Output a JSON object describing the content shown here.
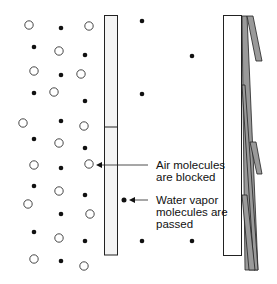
{
  "diagram": {
    "colors": {
      "stroke": "#222222",
      "membrane_fill": "#f4f4f4",
      "flap_fill": "#9a9a9a",
      "dot": "#111111"
    },
    "labels": {
      "air": [
        "Air molecules",
        "are blocked"
      ],
      "water": [
        "Water vapor",
        "molecules are",
        "passed"
      ]
    },
    "air_molecules_left": [
      [
        29,
        25
      ],
      [
        89,
        26
      ],
      [
        59,
        51
      ],
      [
        34,
        71
      ],
      [
        81,
        74
      ],
      [
        54,
        92
      ],
      [
        23,
        123
      ],
      [
        84,
        126
      ],
      [
        59,
        143
      ],
      [
        34,
        165
      ],
      [
        89,
        164
      ],
      [
        59,
        191
      ],
      [
        28,
        204
      ],
      [
        90,
        214
      ],
      [
        59,
        238
      ],
      [
        34,
        259
      ],
      [
        84,
        266
      ]
    ],
    "water_molecules_left": [
      [
        61,
        28
      ],
      [
        34,
        47
      ],
      [
        85,
        55
      ],
      [
        61,
        75
      ],
      [
        34,
        93
      ],
      [
        85,
        101
      ],
      [
        61,
        121
      ],
      [
        34,
        139
      ],
      [
        85,
        148
      ],
      [
        61,
        168
      ],
      [
        34,
        186
      ],
      [
        85,
        195
      ],
      [
        61,
        214
      ],
      [
        34,
        232
      ],
      [
        85,
        241
      ],
      [
        61,
        261
      ]
    ],
    "water_molecules_right": [
      [
        142,
        21
      ],
      [
        192,
        56
      ],
      [
        142,
        94
      ],
      [
        192,
        241
      ],
      [
        142,
        241
      ]
    ]
  }
}
